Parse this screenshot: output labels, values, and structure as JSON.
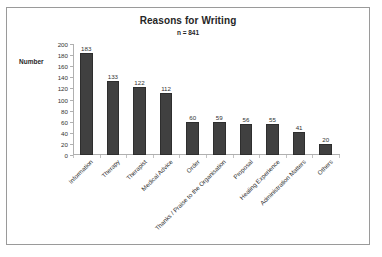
{
  "chart_data": {
    "type": "bar",
    "title": "Reasons for Writing",
    "subtitle": "n = 841",
    "xlabel": "",
    "ylabel": "Number",
    "ylim": [
      0,
      200
    ],
    "ytick_step": 20,
    "yticks": [
      200,
      180,
      160,
      140,
      120,
      100,
      80,
      60,
      40,
      20,
      0
    ],
    "grid": false,
    "legend": false,
    "bar_color": "#404040",
    "bar_border_color": "#2e2e2e",
    "categories": [
      "Information",
      "Therapy",
      "Therapist",
      "Medical Advice",
      "Order",
      "Thanks / Praise to the Organisation",
      "Proposal",
      "Healing Experience",
      "Administration Matters",
      "Others"
    ],
    "values": [
      183,
      133,
      122,
      112,
      60,
      59,
      56,
      55,
      41,
      20
    ],
    "data_labels": [
      "183",
      "133",
      "122",
      "112",
      "60",
      "59",
      "56",
      "55",
      "41",
      "20"
    ]
  }
}
